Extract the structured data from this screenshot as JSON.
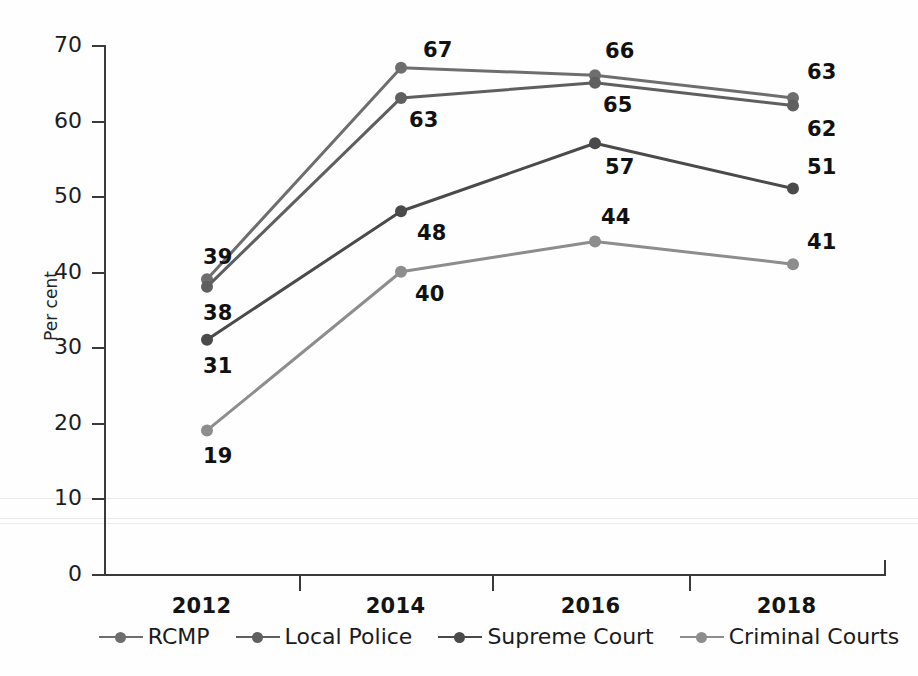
{
  "chart_data": {
    "type": "line",
    "title": "",
    "xlabel": "",
    "ylabel": "Per cent",
    "categories": [
      "2012",
      "2014",
      "2016",
      "2018"
    ],
    "ylim": [
      0,
      70
    ],
    "ytick_labels": [
      "0",
      "10",
      "20",
      "30",
      "40",
      "50",
      "60",
      "70"
    ],
    "ytick_values": [
      0,
      10,
      20,
      30,
      40,
      50,
      60,
      70
    ],
    "grid": false,
    "legend_position": "bottom",
    "data_labels": true,
    "series": [
      {
        "name": "RCMP",
        "color": "#6e6e6e",
        "values": [
          39,
          67,
          66,
          63
        ],
        "labels": [
          "39",
          "67",
          "66",
          "63"
        ]
      },
      {
        "name": "Local Police",
        "color": "#5f5f5f",
        "values": [
          38,
          63,
          65,
          62
        ],
        "labels": [
          "38",
          "63",
          "65",
          "62"
        ]
      },
      {
        "name": "Supreme Court",
        "color": "#4a4a4a",
        "values": [
          31,
          48,
          57,
          51
        ],
        "labels": [
          "31",
          "48",
          "57",
          "51"
        ]
      },
      {
        "name": "Criminal Courts",
        "color": "#8d8d8d",
        "values": [
          19,
          40,
          44,
          41
        ],
        "labels": [
          "19",
          "40",
          "44",
          "41"
        ]
      }
    ]
  },
  "axis": {
    "y_title": "Per cent"
  },
  "legend": {
    "items": [
      {
        "label": "RCMP"
      },
      {
        "label": "Local Police"
      },
      {
        "label": "Supreme Court"
      },
      {
        "label": "Criminal Courts"
      }
    ]
  },
  "footer": {
    "caption": ""
  }
}
